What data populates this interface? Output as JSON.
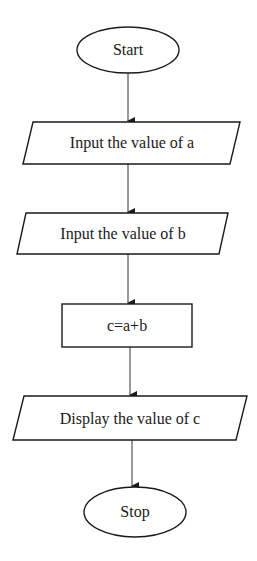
{
  "diagram": {
    "type": "flowchart",
    "nodes": [
      {
        "id": "start",
        "shape": "terminator",
        "label": "Start"
      },
      {
        "id": "input_a",
        "shape": "input-output",
        "label": "Input the value of a"
      },
      {
        "id": "input_b",
        "shape": "input-output",
        "label": "Input the value of b"
      },
      {
        "id": "process",
        "shape": "process",
        "label": "c=a+b"
      },
      {
        "id": "output_c",
        "shape": "input-output",
        "label": "Display the value of c"
      },
      {
        "id": "stop",
        "shape": "terminator",
        "label": "Stop"
      }
    ],
    "edges": [
      {
        "from": "start",
        "to": "input_a"
      },
      {
        "from": "input_a",
        "to": "input_b"
      },
      {
        "from": "input_b",
        "to": "process"
      },
      {
        "from": "process",
        "to": "output_c"
      },
      {
        "from": "output_c",
        "to": "stop"
      }
    ]
  },
  "labels": {
    "start": "Start",
    "input_a": "Input the value of a",
    "input_b": "Input the value of b",
    "process": "c=a+b",
    "output_c": "Display the value of c",
    "stop": "Stop"
  },
  "colors": {
    "stroke": "#1a1a1a",
    "background": "#ffffff"
  }
}
